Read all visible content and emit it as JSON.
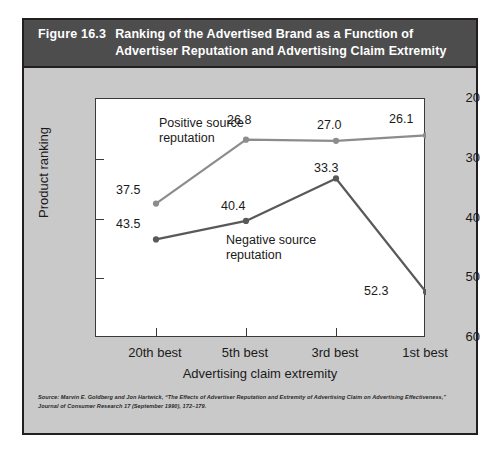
{
  "figure": {
    "number": "Figure 16.3",
    "title": "Ranking of the Advertised Brand as a Function of Advertiser Reputation and Advertising Claim Extremity",
    "source": "Source: Marvin E. Goldberg and Jon Hartwick, “The Effects of Advertiser Reputation and Extremity of Advertising Claim on Advertising Effectiveness,” Journal of Consumer Research 17 (September 1990), 172–179."
  },
  "colors": {
    "header_bar": "#4d4d4d",
    "card_background": "#c9c9c9",
    "plot_background": "#ffffff",
    "border": "#231f20",
    "positive_series": "#8c8c8c",
    "negative_series": "#595959"
  },
  "chart_data": {
    "type": "line",
    "title": "Ranking of the Advertised Brand as a Function of Advertiser Reputation and Advertising Claim Extremity",
    "xlabel": "Advertising claim extremity",
    "ylabel": "Product ranking",
    "categories": [
      "20th best",
      "5th best",
      "3rd best",
      "1st best"
    ],
    "yticks": [
      20,
      30,
      40,
      50,
      60
    ],
    "ylim": [
      20,
      60
    ],
    "y_axis_inverted": true,
    "grid": false,
    "legend": "inline-annotations",
    "series": [
      {
        "name": "Positive source reputation",
        "values": [
          37.5,
          26.8,
          27.0,
          26.1
        ],
        "labels": [
          "37.5",
          "26.8",
          "27.0",
          "26.1"
        ]
      },
      {
        "name": "Negative source reputation",
        "values": [
          43.5,
          40.4,
          33.3,
          52.3
        ],
        "labels": [
          "43.5",
          "40.4",
          "33.3",
          "52.3"
        ]
      }
    ]
  }
}
